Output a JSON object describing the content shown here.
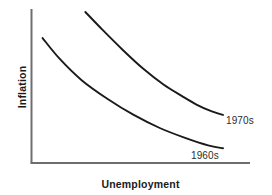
{
  "chart_data": {
    "type": "line",
    "title": "",
    "subtitle": "",
    "xlabel": "Unemployment",
    "ylabel": "Inflation",
    "grid": false,
    "legend_position": "inline-end-of-curve",
    "axis_style": {
      "axis_color": "#6e6e6e",
      "curve_color": "#1a1a1a",
      "x_axis_ticks": [],
      "y_axis_ticks": [],
      "xlim_labels": [],
      "ylim_labels": []
    },
    "annotations": [
      {
        "text": "1970s",
        "attached_series": "1970s"
      },
      {
        "text": "1960s",
        "attached_series": "1960s"
      }
    ],
    "series": [
      {
        "name": "1960s",
        "color": "#1a1a1a",
        "label": "1960s",
        "x": [
          0.03,
          0.12,
          0.24,
          0.38,
          0.52,
          0.66,
          0.8,
          0.92,
          1.0
        ],
        "y": [
          0.82,
          0.68,
          0.53,
          0.4,
          0.29,
          0.2,
          0.13,
          0.08,
          0.06
        ]
      },
      {
        "name": "1970s",
        "color": "#1a1a1a",
        "label": "1970s",
        "x": [
          0.26,
          0.35,
          0.46,
          0.57,
          0.68,
          0.78,
          0.86,
          0.93,
          1.0
        ],
        "y": [
          1.0,
          0.88,
          0.74,
          0.61,
          0.5,
          0.42,
          0.36,
          0.32,
          0.29
        ]
      }
    ],
    "axis_ranges": {
      "xlim": [
        0,
        1
      ],
      "ylim": [
        0,
        1
      ]
    },
    "description_values": {
      "curve_count": 2,
      "relationship": "downward-sloping convex"
    }
  },
  "labels": {
    "y_axis": "Inflation",
    "x_axis": "Unemployment",
    "series_1960s": "1960s",
    "series_1970s": "1970s"
  },
  "colors": {
    "background": "#ffffff",
    "axis": "#6e6e6e",
    "curve": "#1a1a1a",
    "label_text": "#1a1a1a",
    "annotation_text": "#2b2b2b"
  }
}
